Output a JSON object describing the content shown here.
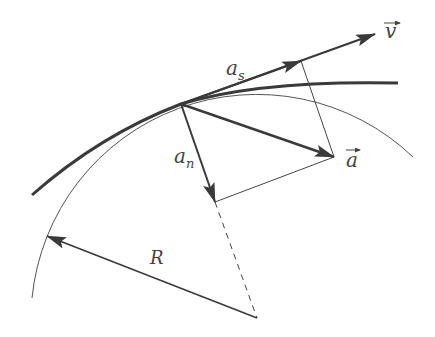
{
  "diagram": {
    "colors": {
      "background": "#ffffff",
      "stroke": "#3a3a3a",
      "thin_stroke": "#555555",
      "label": "#444444"
    },
    "labels": {
      "velocity": "v",
      "acceleration": "a",
      "tangential": "a",
      "tangential_sub": "s",
      "normal": "a",
      "normal_sub": "n",
      "radius": "R"
    },
    "points": {
      "contact": [
        181,
        104
      ],
      "velocity_tip": [
        375,
        34
      ],
      "tangential_tip": [
        301,
        61
      ],
      "acceleration_tip": [
        334,
        157
      ],
      "normal_tip": [
        215,
        202
      ],
      "center": [
        257,
        318
      ],
      "radius_tip": [
        47,
        236
      ]
    },
    "osculating_circle": {
      "center": [
        257,
        318
      ],
      "radius": 226
    }
  }
}
